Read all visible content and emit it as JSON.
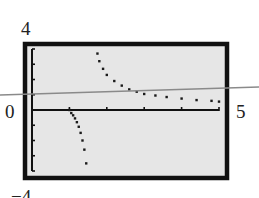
{
  "chart_data": {
    "type": "scatter",
    "title": "",
    "window": {
      "xmin": 0,
      "xmax": 5,
      "ymin": -4,
      "ymax": 4
    },
    "xlim": [
      0,
      5
    ],
    "ylim": [
      -4,
      4
    ],
    "xlabel": "",
    "ylabel": "",
    "tick_labels": {
      "y_top": "4",
      "x_left": "0",
      "x_right": "5",
      "y_bottom": "−4"
    },
    "x_ticks": [
      1,
      2,
      3,
      4,
      5
    ],
    "y_ticks": [
      -4,
      -3,
      -2,
      -1,
      1,
      2,
      3,
      4
    ],
    "grid": false,
    "series": [
      {
        "name": "lower-branch",
        "style": "dotted",
        "color": "#1a1a1a",
        "x": [
          1.0,
          1.05,
          1.1,
          1.15,
          1.2,
          1.25,
          1.3,
          1.35,
          1.4,
          1.45
        ],
        "y": [
          0.0,
          -0.2,
          -0.35,
          -0.55,
          -0.8,
          -1.1,
          -1.5,
          -2.0,
          -2.6,
          -3.5
        ]
      },
      {
        "name": "upper-branch",
        "style": "dotted",
        "color": "#1a1a1a",
        "x": [
          1.75,
          1.8,
          1.9,
          2.0,
          2.2,
          2.4,
          2.6,
          2.8,
          3.0,
          3.3,
          3.6,
          4.0,
          4.4,
          4.8,
          5.0
        ],
        "y": [
          3.7,
          3.2,
          2.7,
          2.3,
          1.9,
          1.6,
          1.35,
          1.2,
          1.05,
          0.95,
          0.85,
          0.75,
          0.65,
          0.6,
          0.55
        ]
      },
      {
        "name": "reference-line",
        "style": "solid",
        "color": "#8a8a8a",
        "x": [
          -0.55,
          5.9
        ],
        "y": [
          0.6,
          1.0
        ]
      }
    ]
  }
}
